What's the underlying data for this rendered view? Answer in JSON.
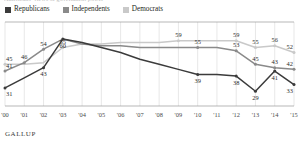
{
  "title_remnant": "Americans' views of government power",
  "legend": {
    "items": [
      {
        "label": "Republicans",
        "color": "#3b3b3b",
        "key": "republicans"
      },
      {
        "label": "Independents",
        "color": "#8a8a8a",
        "key": "independents"
      },
      {
        "label": "Democrats",
        "color": "#c9c9c9",
        "key": "democrats"
      }
    ]
  },
  "footer": {
    "brand": "GALLUP"
  },
  "colors": {
    "republicans": "#3b3b3b",
    "independents": "#8a8a8a",
    "democrats": "#c9c9c9",
    "grid": "#d7d7d7",
    "axis": "#9a9a9a",
    "label_text": "#2b2b2b"
  },
  "chart_data": {
    "type": "line",
    "title": "",
    "xlabel": "",
    "ylabel": "",
    "ylim": [
      25,
      63
    ],
    "grid": "vertical",
    "legend_position": "top-left",
    "categories": [
      "'00",
      "'01",
      "'02",
      "'03",
      "'04",
      "'05",
      "'06",
      "'07",
      "'08",
      "'09",
      "'10",
      "'11",
      "'12",
      "'13",
      "'14",
      "'15"
    ],
    "series": [
      {
        "name": "Republicans",
        "color": "#3b3b3b",
        "values": [
          31,
          37,
          43,
          60,
          58,
          55,
          52,
          48,
          45,
          42,
          39,
          39,
          38,
          29,
          41,
          33
        ],
        "labels": {
          "0": "31",
          "2": "43",
          "3": "60",
          "10": "39",
          "12": "38",
          "13": "29",
          "14": "41",
          "15": "33"
        }
      },
      {
        "name": "Independents",
        "color": "#8a8a8a",
        "values": [
          41,
          46,
          54,
          60,
          57,
          56,
          56,
          55,
          55,
          55,
          55,
          55,
          53,
          45,
          43,
          42
        ],
        "labels": {
          "0": "41",
          "1": "46",
          "2": "54",
          "10": "55",
          "12": "53",
          "13": "45",
          "14": "43",
          "15": "42"
        }
      },
      {
        "name": "Democrats",
        "color": "#c9c9c9",
        "values": [
          45,
          45,
          46,
          55,
          57,
          57,
          58,
          58,
          58,
          59,
          59,
          59,
          59,
          55,
          56,
          52
        ],
        "labels": {
          "0": "45",
          "3": "55",
          "9": "59",
          "12": "59",
          "13": "55",
          "14": "56",
          "15": "52"
        }
      }
    ]
  }
}
